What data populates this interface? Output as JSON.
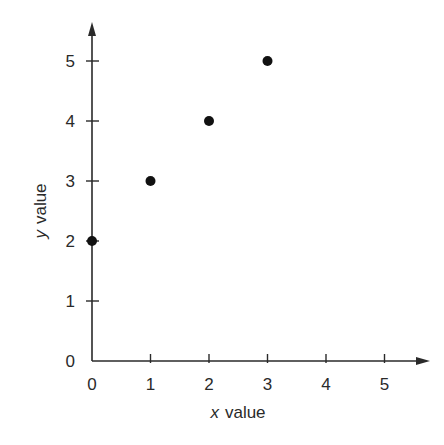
{
  "chart_data": {
    "type": "scatter",
    "title": "",
    "xlabel": "x value",
    "xlabel_var": "x",
    "xlabel_rest": "value",
    "ylabel": "y value",
    "ylabel_var": "y",
    "ylabel_rest": "value",
    "xlim": [
      0,
      5.5
    ],
    "ylim": [
      0,
      5.5
    ],
    "x_ticks": [
      0,
      1,
      2,
      3,
      4,
      5
    ],
    "y_ticks": [
      0,
      1,
      2,
      3,
      4,
      5
    ],
    "grid": false,
    "legend": null,
    "series": [
      {
        "name": "points",
        "x": [
          0,
          1,
          2,
          3
        ],
        "y": [
          2,
          3,
          4,
          5
        ],
        "color": "#111111"
      }
    ]
  },
  "colors": {
    "axis": "#2a2a2a",
    "marker": "#111111",
    "background": "#ffffff"
  }
}
